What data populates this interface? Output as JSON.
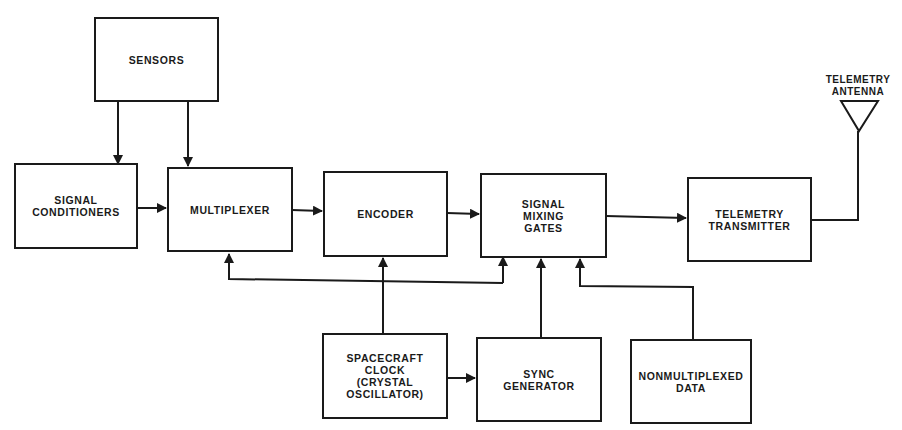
{
  "diagram": {
    "type": "block-diagram",
    "colors": {
      "line": "#1a1a1a",
      "background": "#ffffff"
    },
    "blocks": {
      "sensors": "SENSORS",
      "signal_conditioners": "SIGNAL\nCONDITIONERS",
      "multiplexer": "MULTIPLEXER",
      "encoder": "ENCODER",
      "signal_mixing_gates": "SIGNAL\nMIXING\nGATES",
      "telemetry_transmitter": "TELEMETRY\nTRANSMITTER",
      "spacecraft_clock": "SPACECRAFT\nCLOCK\n(CRYSTAL\nOSCILLATOR)",
      "sync_generator": "SYNC\nGENERATOR",
      "nonmultiplexed_data": "NONMULTIPLEXED\nDATA"
    },
    "antenna": {
      "label": "TELEMETRY\nANTENNA"
    },
    "connections": [
      {
        "from": "SENSORS",
        "to": "SIGNAL CONDITIONERS"
      },
      {
        "from": "SENSORS",
        "to": "MULTIPLEXER"
      },
      {
        "from": "SIGNAL CONDITIONERS",
        "to": "MULTIPLEXER"
      },
      {
        "from": "MULTIPLEXER",
        "to": "ENCODER"
      },
      {
        "from": "ENCODER",
        "to": "SIGNAL MIXING GATES"
      },
      {
        "from": "SIGNAL MIXING GATES",
        "to": "TELEMETRY TRANSMITTER"
      },
      {
        "from": "TELEMETRY TRANSMITTER",
        "to": "TELEMETRY ANTENNA"
      },
      {
        "from": "SPACECRAFT CLOCK",
        "to": "ENCODER"
      },
      {
        "from": "SPACECRAFT CLOCK",
        "to": "MULTIPLEXER"
      },
      {
        "from": "SPACECRAFT CLOCK",
        "to": "SIGNAL MIXING GATES"
      },
      {
        "from": "SPACECRAFT CLOCK",
        "to": "SYNC GENERATOR"
      },
      {
        "from": "SYNC GENERATOR",
        "to": "SIGNAL MIXING GATES"
      },
      {
        "from": "NONMULTIPLEXED DATA",
        "to": "SIGNAL MIXING GATES"
      }
    ]
  }
}
